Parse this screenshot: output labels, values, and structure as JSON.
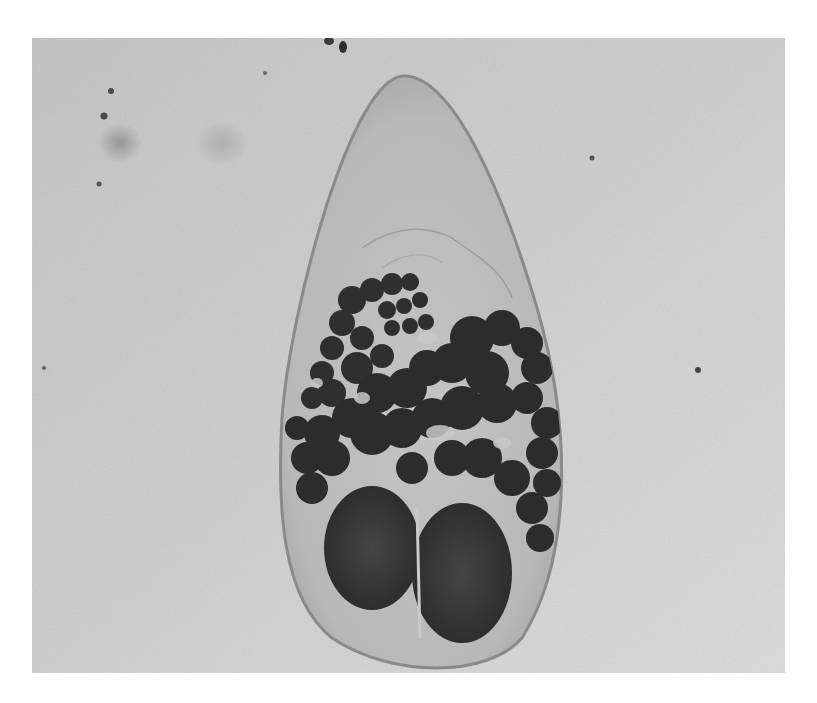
{
  "figure": {
    "type": "grayscale-micrograph",
    "colors": {
      "page_background": "#ffffff",
      "photo_background": "#cfcfcf",
      "organism_body": "#bdbdbd",
      "organism_outline": "#8a8a8a",
      "dark_mass": "#2e2e2e",
      "oval_bodies": "#3a3a3a"
    }
  }
}
